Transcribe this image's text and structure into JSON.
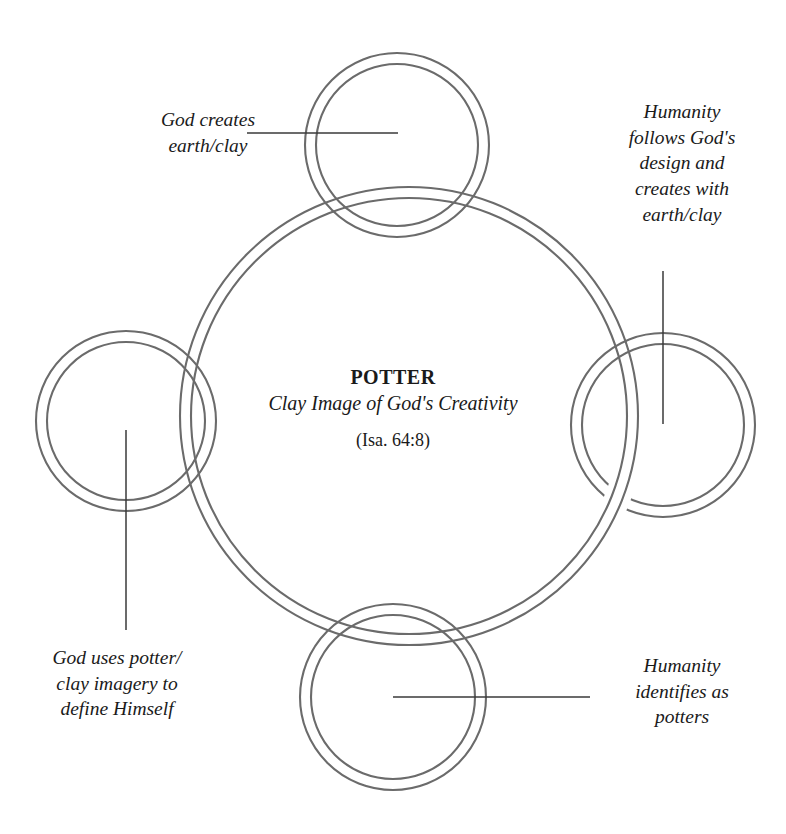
{
  "diagram": {
    "type": "interlocking-rings-concept-diagram",
    "title": "POTTER",
    "subtitle": "Clay Image of God's Creativity",
    "reference": "(Isa. 64:8)",
    "stroke_color": "#6b6b6b",
    "leader_color": "#3a3a3a",
    "background_color": "#ffffff",
    "center": {
      "title": "POTTER",
      "subtitle": "Clay Image of God's\nCreativity",
      "reference": "(Isa. 64:8)"
    },
    "nodes": [
      {
        "id": "top",
        "position": "top",
        "label": "God creates\nearth/clay",
        "label_side": "left",
        "leader": "horizontal"
      },
      {
        "id": "right",
        "position": "right",
        "label": "Humanity\nfollows God's\ndesign and\ncreates with\nearth/clay",
        "label_side": "above",
        "leader": "vertical"
      },
      {
        "id": "left",
        "position": "left",
        "label": "God uses potter/\nclay imagery to\ndefine Himself",
        "label_side": "below",
        "leader": "vertical"
      },
      {
        "id": "bottom",
        "position": "bottom",
        "label": "Humanity\nidentifies as\npotters",
        "label_side": "right",
        "leader": "horizontal"
      }
    ]
  }
}
